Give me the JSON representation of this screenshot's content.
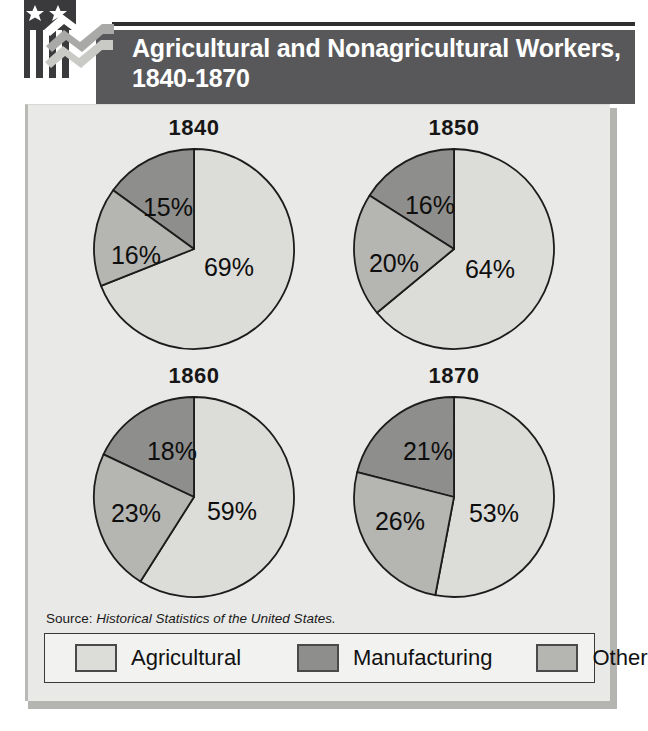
{
  "header": {
    "title": "Agricultural and Nonagricultural Workers, 1840-1870",
    "logo_name": "flag-chevron-logo"
  },
  "source": {
    "prefix": "Source:",
    "citation": "Historical Statistics of the United States."
  },
  "legend": {
    "items": [
      {
        "label": "Agricultural",
        "color": "#dcdcd8"
      },
      {
        "label": "Manufacturing",
        "color": "#8e8e8c"
      },
      {
        "label": "Other",
        "color": "#b5b5b1"
      }
    ]
  },
  "colors": {
    "agricultural": "#dcdcd8",
    "manufacturing": "#8e8e8c",
    "other": "#b5b5b1",
    "header_bar": "#58585a",
    "panel_bg": "#e9e9e7",
    "outline": "#1c1c1c"
  },
  "chart_data": {
    "type": "pie",
    "title": "Agricultural and Nonagricultural Workers, 1840-1870",
    "unit": "percent",
    "legend_position": "bottom",
    "series_names": [
      "Agricultural",
      "Manufacturing",
      "Other"
    ],
    "source": "Historical Statistics of the United States.",
    "charts": [
      {
        "year": "1840",
        "slices": [
          {
            "label": "Agricultural",
            "value": 69,
            "display": "69%"
          },
          {
            "label": "Manufacturing",
            "value": 15,
            "display": "15%"
          },
          {
            "label": "Other",
            "value": 16,
            "display": "16%"
          }
        ]
      },
      {
        "year": "1850",
        "slices": [
          {
            "label": "Agricultural",
            "value": 64,
            "display": "64%"
          },
          {
            "label": "Manufacturing",
            "value": 16,
            "display": "16%"
          },
          {
            "label": "Other",
            "value": 20,
            "display": "20%"
          }
        ]
      },
      {
        "year": "1860",
        "slices": [
          {
            "label": "Agricultural",
            "value": 59,
            "display": "59%"
          },
          {
            "label": "Manufacturing",
            "value": 18,
            "display": "18%"
          },
          {
            "label": "Other",
            "value": 23,
            "display": "23%"
          }
        ]
      },
      {
        "year": "1870",
        "slices": [
          {
            "label": "Agricultural",
            "value": 53,
            "display": "53%"
          },
          {
            "label": "Manufacturing",
            "value": 21,
            "display": "21%"
          },
          {
            "label": "Other",
            "value": 26,
            "display": "26%"
          }
        ]
      }
    ]
  }
}
